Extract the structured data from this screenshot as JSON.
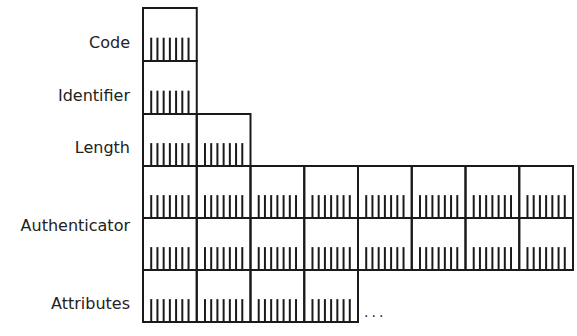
{
  "diagram": {
    "title": "",
    "bits_per_octet": 8,
    "fields": [
      {
        "name": "Code",
        "octets_per_row": [
          1
        ]
      },
      {
        "name": "Identifier",
        "octets_per_row": [
          1
        ]
      },
      {
        "name": "Length",
        "octets_per_row": [
          2
        ]
      },
      {
        "name": "Authenticator",
        "octets_per_row": [
          8,
          8
        ]
      },
      {
        "name": "Attributes",
        "octets_per_row": [
          4
        ],
        "continues": true
      }
    ],
    "continuation_text": "...",
    "line_color": "#1a1a1a",
    "text_color": "#222222"
  }
}
